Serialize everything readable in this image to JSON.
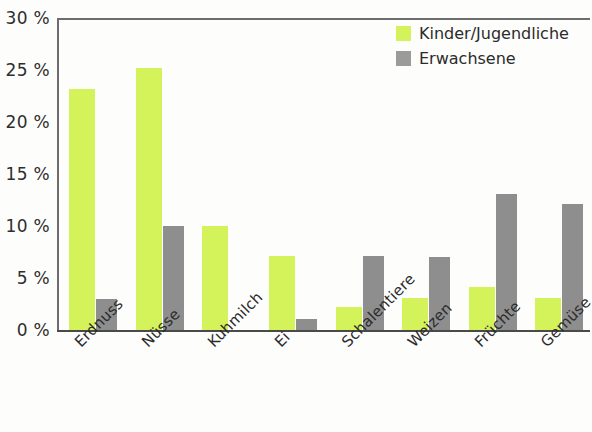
{
  "chart_data": {
    "type": "bar",
    "title": "",
    "xlabel": "",
    "ylabel": "",
    "ylim": [
      0,
      30
    ],
    "ytick_labels": [
      "30 %",
      "25 %",
      "20 %",
      "15 %",
      "10 %",
      "5 %",
      "0 %"
    ],
    "ytick_values": [
      30,
      25,
      20,
      15,
      10,
      5,
      0
    ],
    "grid": false,
    "legend_position": "top-right",
    "categories": [
      "Erdnuss",
      "Nüsse",
      "Kuhmilch",
      "Ei",
      "Schalentiere",
      "Weizen",
      "Früchte",
      "Gemüse"
    ],
    "series": [
      {
        "name": "Kinder/Jugendliche",
        "color": "#d4f25a",
        "values": [
          23.2,
          25.2,
          10.0,
          7.1,
          2.2,
          3.1,
          4.1,
          3.1
        ]
      },
      {
        "name": "Erwachsene",
        "color": "#8e8e8e",
        "values": [
          3.0,
          10.0,
          0,
          1.1,
          7.1,
          7.0,
          13.1,
          12.1
        ]
      }
    ]
  },
  "legend": {
    "items": [
      {
        "label": "Kinder/Jugendliche"
      },
      {
        "label": "Erwachsene"
      }
    ]
  }
}
